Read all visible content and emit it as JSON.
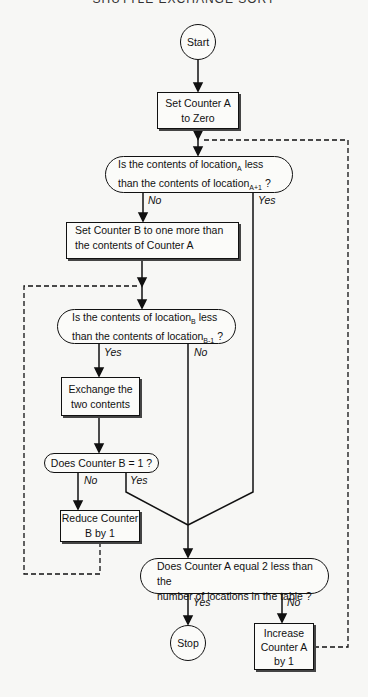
{
  "header": {
    "title": "SHUTTLE EXCHANGE SORT"
  },
  "nodes": {
    "start": "Start",
    "set_a_zero": {
      "line1": "Set Counter A",
      "line2": "to Zero"
    },
    "decision_a": {
      "line1_pre": "Is the contents of location",
      "line1_sub": "A",
      "line1_post": " less",
      "line2_pre": "than the contents of location",
      "line2_sub": "A+1",
      "line2_post": " ?"
    },
    "set_b": {
      "line1": "Set Counter B to one more than",
      "line2": "the contents of Counter A"
    },
    "decision_b": {
      "line1_pre": "Is the contents of location",
      "line1_sub": "B",
      "line1_post": " less",
      "line2_pre": "than the contents of location",
      "line2_sub": "B-1",
      "line2_post": " ?"
    },
    "exchange": {
      "line1": "Exchange the",
      "line2": "two contents"
    },
    "decision_b_eq_1": "Does Counter B = 1 ?",
    "reduce_b": {
      "line1": "Reduce Counter",
      "line2": "B by 1"
    },
    "decision_a_end": {
      "line1": "Does Counter A equal 2 less than the",
      "line2": "number of locations in the table ?"
    },
    "stop": "Stop",
    "increase_a": {
      "line1": "Increase",
      "line2": "Counter A",
      "line3": "by 1"
    }
  },
  "labels": {
    "d1_no": "No",
    "d1_yes": "Yes",
    "d2_yes": "Yes",
    "d2_no": "No",
    "d3_no": "No",
    "d3_yes": "Yes",
    "d4_yes": "Yes",
    "d4_no": "No"
  }
}
